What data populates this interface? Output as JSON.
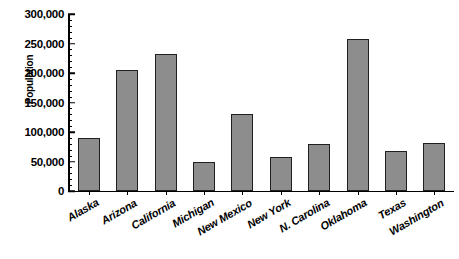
{
  "chart_data": {
    "type": "bar",
    "title": "",
    "xlabel": "",
    "ylabel": "Population",
    "ylim": [
      0,
      300000
    ],
    "ytick_step": 50000,
    "minor_ticks_per_interval": 5,
    "grid": false,
    "legend": null,
    "bar_fill_color": "#8d8d8d",
    "bar_border_color": "#231f20",
    "axis_color": "#000000",
    "background_color": "#ffffff",
    "categories": [
      "Alaska",
      "Arizona",
      "California",
      "Michigan",
      "New Mexico",
      "New York",
      "N. Carolina",
      "Oklahoma",
      "Texas",
      "Washington"
    ],
    "values": [
      90000,
      205000,
      232000,
      49000,
      130000,
      57000,
      80000,
      258000,
      67000,
      82000
    ],
    "ytick_labels": [
      "0",
      "50,000",
      "100,000",
      "150,000",
      "200,000",
      "250,000",
      "300,000"
    ],
    "ytick_values": [
      0,
      50000,
      100000,
      150000,
      200000,
      250000,
      300000
    ]
  }
}
